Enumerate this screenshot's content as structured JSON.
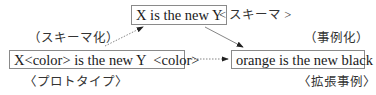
{
  "diagram": {
    "nodes": {
      "schema": {
        "text": "X is the new Y",
        "tag": "< スキーマ >"
      },
      "prototype": {
        "text": "X<color> is the new Y  <color>",
        "tag": "〈プロトタイプ〉"
      },
      "instance": {
        "text": "orange is the new black",
        "tag": "〈拡張事例〉"
      }
    },
    "edges": {
      "schematization": {
        "label": "（スキーマ化）",
        "from": "prototype",
        "to": "schema",
        "style": "dotted"
      },
      "instantiation": {
        "label": "（事例化）",
        "from": "schema",
        "to": "instance",
        "style": "solid"
      },
      "extension": {
        "label": "",
        "from": "prototype",
        "to": "instance",
        "style": "dotted"
      }
    },
    "colors": {
      "border": "#8a8a8a",
      "text": "#1a1a1a",
      "arrow": "#555555"
    }
  }
}
